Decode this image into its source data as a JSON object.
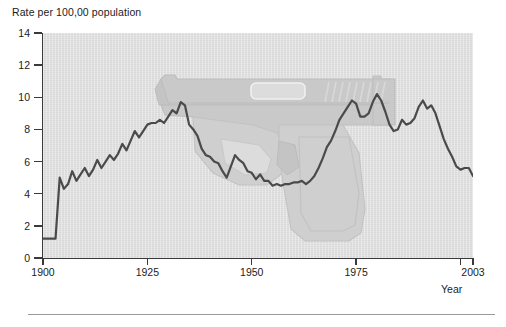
{
  "chart_data": {
    "type": "line",
    "title": "",
    "ylabel": "Rate per 100,00 population",
    "xlabel": "Year",
    "xlim": [
      1900,
      2003
    ],
    "ylim": [
      0,
      14
    ],
    "grid": false,
    "legend": null,
    "y_ticks": [
      0,
      2,
      4,
      6,
      8,
      10,
      12,
      14
    ],
    "y_tick_labels": [
      "0",
      "2",
      "4",
      "6",
      "8",
      "10",
      "12",
      "14"
    ],
    "x_ticks": [
      1900,
      1925,
      1950,
      1975,
      2003
    ],
    "x_tick_labels": [
      "1900",
      "1925",
      "1950",
      "1975",
      "2003"
    ],
    "line_color": "#4a4a4a",
    "plot_background": "#dcdcdc",
    "page_background": "#ffffff",
    "watermark": "handgun-silhouette",
    "series": [
      {
        "name": "Homicide rate",
        "x": [
          1900,
          1901,
          1902,
          1903,
          1904,
          1905,
          1906,
          1907,
          1908,
          1909,
          1910,
          1911,
          1912,
          1913,
          1914,
          1915,
          1916,
          1917,
          1918,
          1919,
          1920,
          1921,
          1922,
          1923,
          1924,
          1925,
          1926,
          1927,
          1928,
          1929,
          1930,
          1931,
          1932,
          1933,
          1934,
          1935,
          1936,
          1937,
          1938,
          1939,
          1940,
          1941,
          1942,
          1943,
          1944,
          1945,
          1946,
          1947,
          1948,
          1949,
          1950,
          1951,
          1952,
          1953,
          1954,
          1955,
          1956,
          1957,
          1958,
          1959,
          1960,
          1961,
          1962,
          1963,
          1964,
          1965,
          1966,
          1967,
          1968,
          1969,
          1970,
          1971,
          1972,
          1973,
          1974,
          1975,
          1976,
          1977,
          1978,
          1979,
          1980,
          1981,
          1982,
          1983,
          1984,
          1985,
          1986,
          1987,
          1988,
          1989,
          1990,
          1991,
          1992,
          1993,
          1994,
          1995,
          1996,
          1997,
          1998,
          1999,
          2000,
          2001,
          2002,
          2003
        ],
        "y": [
          1.2,
          1.2,
          1.2,
          1.2,
          5.0,
          4.3,
          4.6,
          5.4,
          4.8,
          5.2,
          5.6,
          5.1,
          5.5,
          6.1,
          5.6,
          6.0,
          6.4,
          6.1,
          6.5,
          7.1,
          6.7,
          7.3,
          7.9,
          7.5,
          7.9,
          8.3,
          8.4,
          8.4,
          8.6,
          8.4,
          8.8,
          9.2,
          9.0,
          9.7,
          9.5,
          8.3,
          8.0,
          7.6,
          6.8,
          6.4,
          6.3,
          6.0,
          5.9,
          5.4,
          5.0,
          5.7,
          6.4,
          6.1,
          5.9,
          5.4,
          5.3,
          4.9,
          5.2,
          4.8,
          4.8,
          4.5,
          4.6,
          4.5,
          4.6,
          4.6,
          4.7,
          4.7,
          4.8,
          4.6,
          4.8,
          5.1,
          5.6,
          6.2,
          6.9,
          7.3,
          7.9,
          8.6,
          9.0,
          9.4,
          9.8,
          9.6,
          8.8,
          8.8,
          9.0,
          9.7,
          10.2,
          9.8,
          9.1,
          8.3,
          7.9,
          8.0,
          8.6,
          8.3,
          8.4,
          8.7,
          9.4,
          9.8,
          9.3,
          9.5,
          9.0,
          8.2,
          7.4,
          6.8,
          6.3,
          5.7,
          5.5,
          5.6,
          5.6,
          5.1
        ]
      }
    ]
  },
  "figure": {
    "y_axis_title": "Rate per 100,00 population",
    "x_axis_title": "Year",
    "y_tick_labels": [
      "14",
      "12",
      "10",
      "8",
      "6",
      "4",
      "2",
      "0"
    ],
    "x_tick_labels": [
      "1900",
      "1925",
      "1950",
      "1975",
      "2003"
    ]
  }
}
